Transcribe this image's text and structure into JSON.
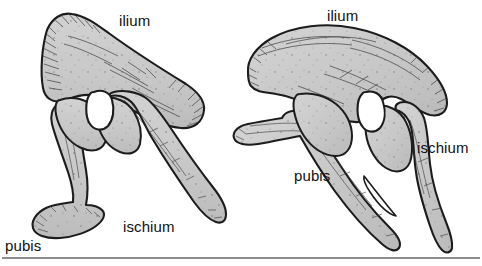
{
  "figure": {
    "kind": "scientific-illustration",
    "specimen_count": 2,
    "background_color": "#ffffff",
    "bone_fill_color": "#c9c9c9",
    "bone_outline_color": "#1a1a1a",
    "acetabulum_fill_color": "#ffffff",
    "rule_color": "#8d8d8d"
  },
  "specimens": [
    {
      "id": "left",
      "position": "left",
      "labels": {
        "ilium": "ilium",
        "pubis": "pubis",
        "ischium": "ischium"
      }
    },
    {
      "id": "right",
      "position": "right",
      "labels": {
        "ilium": "ilium",
        "pubis": "pubis",
        "ischium": "ischium"
      }
    }
  ]
}
